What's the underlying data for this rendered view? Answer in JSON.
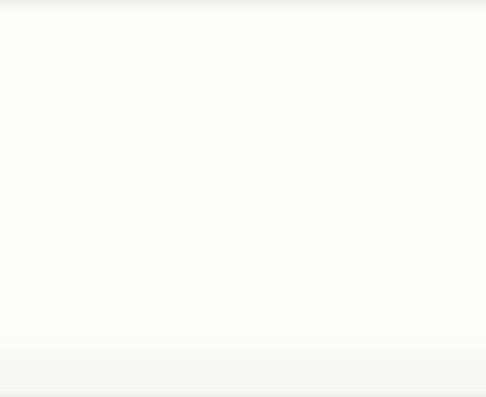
{
  "map": {
    "title": "County Designated Nonattainment Map",
    "date_stamp": "09/2004",
    "legend": {
      "title": "Legend **",
      "entries": [
        {
          "pattern": "light-grid-crosshatch",
          "pollutant_count": 4,
          "label": "County Designated Nonattainment for 4 NAAQS Pollutants",
          "color": "#f2f2f2"
        },
        {
          "pattern": "dark-diagonal-hatch",
          "pollutant_count": 3,
          "label": "County Designated Nonattainment for 3 NAAQS Pollutants",
          "color": "#2f2f2f"
        },
        {
          "pattern": "light-gray-solid",
          "pollutant_count": 2,
          "label": "County Designated Nonattainment for 2 NAAQS Pollutants",
          "color": "#d9d9d9"
        },
        {
          "pattern": "medium-gray-solid",
          "pollutant_count": 1,
          "label": "County Designated Nonattainment for 1 NAAQS Pollutants",
          "color": "#8e8e8e"
        }
      ]
    },
    "colors": {
      "background": "#fbfbfa",
      "state_outline": "#4a4a4a",
      "county_shade_1": "#8e8e8e",
      "county_shade_2": "#d9d9d9",
      "hatch_3": "#2f2f2f",
      "grid_4": "#9a9a9a",
      "text": "#303030"
    },
    "insets": [
      {
        "name": "alaska",
        "shaded": false
      },
      {
        "name": "hawaii",
        "shaded": false
      }
    ]
  }
}
